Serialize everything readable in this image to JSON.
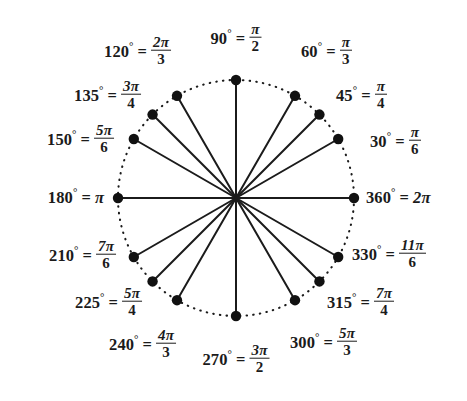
{
  "figure": {
    "type": "unit-circle-diagram",
    "background_color": "#ffffff",
    "line_color": "#1b1b1b",
    "dot_color": "#111111",
    "circle_style": "dotted",
    "center": {
      "x": 236,
      "y": 198
    },
    "radius": 118,
    "dot_radius": 5.2
  },
  "angles": [
    {
      "id": "a30",
      "degrees": "30",
      "degree_text": "30",
      "radian_type": "fraction",
      "numerator": "π",
      "denominator": "6",
      "radian_text": "π/6",
      "deg_value": 30,
      "label_x": 370,
      "label_y": 142,
      "align": "right-label"
    },
    {
      "id": "a45",
      "degrees": "45",
      "degree_text": "45",
      "radian_type": "fraction",
      "numerator": "π",
      "denominator": "4",
      "radian_text": "π/4",
      "deg_value": 45,
      "label_x": 336,
      "label_y": 96,
      "align": "right-label"
    },
    {
      "id": "a60",
      "degrees": "60",
      "degree_text": "60",
      "radian_type": "fraction",
      "numerator": "π",
      "denominator": "3",
      "radian_text": "π/3",
      "deg_value": 60,
      "label_x": 301,
      "label_y": 52,
      "align": "right-label"
    },
    {
      "id": "a90",
      "degrees": "90",
      "degree_text": "90",
      "radian_type": "fraction",
      "numerator": "π",
      "denominator": "2",
      "radian_text": "π/2",
      "deg_value": 90,
      "label_x": 236,
      "label_y": 39,
      "align": "center-label"
    },
    {
      "id": "a120",
      "degrees": "120",
      "degree_text": "120",
      "radian_type": "fraction",
      "numerator": "2π",
      "denominator": "3",
      "radian_text": "2π/3",
      "deg_value": 120,
      "label_x": 171,
      "label_y": 52,
      "align": "left-label"
    },
    {
      "id": "a135",
      "degrees": "135",
      "degree_text": "135",
      "radian_type": "fraction",
      "numerator": "3π",
      "denominator": "4",
      "radian_text": "3π/4",
      "deg_value": 135,
      "label_x": 141,
      "label_y": 96,
      "align": "left-label"
    },
    {
      "id": "a150",
      "degrees": "150",
      "degree_text": "150",
      "radian_type": "fraction",
      "numerator": "5π",
      "denominator": "6",
      "radian_text": "5π/6",
      "deg_value": 150,
      "label_x": 114,
      "label_y": 140,
      "align": "left-label"
    },
    {
      "id": "a180",
      "degrees": "180",
      "degree_text": "180",
      "radian_type": "whole",
      "numerator": "",
      "denominator": "",
      "radian_text": "π",
      "deg_value": 180,
      "label_x": 104,
      "label_y": 198,
      "align": "left-label"
    },
    {
      "id": "a210",
      "degrees": "210",
      "degree_text": "210",
      "radian_type": "fraction",
      "numerator": "7π",
      "denominator": "6",
      "radian_text": "7π/6",
      "deg_value": 210,
      "label_x": 116,
      "label_y": 256,
      "align": "left-label"
    },
    {
      "id": "a225",
      "degrees": "225",
      "degree_text": "225",
      "radian_type": "fraction",
      "numerator": "5π",
      "denominator": "4",
      "radian_text": "5π/4",
      "deg_value": 225,
      "label_x": 142,
      "label_y": 303,
      "align": "left-label"
    },
    {
      "id": "a240",
      "degrees": "240",
      "degree_text": "240",
      "radian_type": "fraction",
      "numerator": "4π",
      "denominator": "3",
      "radian_text": "4π/3",
      "deg_value": 240,
      "label_x": 176,
      "label_y": 345,
      "align": "left-label"
    },
    {
      "id": "a270",
      "degrees": "270",
      "degree_text": "270",
      "radian_type": "fraction",
      "numerator": "3π",
      "denominator": "2",
      "radian_text": "3π/2",
      "deg_value": 270,
      "label_x": 236,
      "label_y": 360,
      "align": "center-label"
    },
    {
      "id": "a300",
      "degrees": "300",
      "degree_text": "300",
      "radian_type": "fraction",
      "numerator": "5π",
      "denominator": "3",
      "radian_text": "5π/3",
      "deg_value": 300,
      "label_x": 290,
      "label_y": 343,
      "align": "right-label"
    },
    {
      "id": "a315",
      "degrees": "315",
      "degree_text": "315",
      "radian_type": "fraction",
      "numerator": "7π",
      "denominator": "4",
      "radian_text": "7π/4",
      "deg_value": 315,
      "label_x": 327,
      "label_y": 303,
      "align": "right-label"
    },
    {
      "id": "a330",
      "degrees": "330",
      "degree_text": "330",
      "radian_type": "fraction",
      "numerator": "11π",
      "denominator": "6",
      "radian_text": "11π/6",
      "deg_value": 330,
      "label_x": 352,
      "label_y": 255,
      "align": "right-label"
    },
    {
      "id": "a360",
      "degrees": "360",
      "degree_text": "360",
      "radian_type": "whole",
      "numerator": "",
      "denominator": "",
      "radian_text": "2π",
      "deg_value": 360,
      "label_x": 366,
      "label_y": 198,
      "align": "right-label"
    }
  ],
  "symbols": {
    "degree_sign": "°",
    "equals": "=",
    "pi": "π"
  }
}
